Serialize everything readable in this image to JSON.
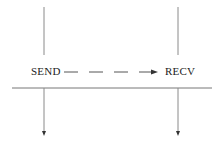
{
  "diagram": {
    "left_node": {
      "label": "SEND"
    },
    "right_node": {
      "label": "RECV"
    },
    "colors": {
      "line": "#888888",
      "arrow": "#333333",
      "text": "#222222"
    }
  }
}
